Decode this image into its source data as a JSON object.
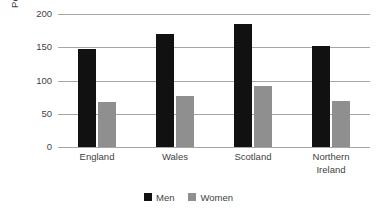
{
  "chart_data": {
    "type": "bar",
    "title": "",
    "subtitle": "",
    "xlabel": "",
    "ylabel": "Per 100,000 deaths",
    "ylim": [
      0,
      200
    ],
    "yticks": [
      200,
      150,
      100,
      50,
      0
    ],
    "ytick_labels": [
      "200",
      "150",
      "100",
      "50",
      "0"
    ],
    "grid": "horizontal",
    "legend_position": "bottom-center",
    "categories": [
      "England",
      "Wales",
      "Scotland",
      "Northern Ireland"
    ],
    "category_label_lines": [
      [
        "England"
      ],
      [
        "Wales"
      ],
      [
        "Scotland"
      ],
      [
        "Northern",
        "Ireland"
      ]
    ],
    "series": [
      {
        "name": "Men",
        "color": "#111111",
        "values": [
          148,
          170,
          185,
          152
        ]
      },
      {
        "name": "Women",
        "color": "#8f8f8f",
        "values": [
          67,
          76,
          92,
          69
        ]
      }
    ]
  },
  "legend": {
    "items": [
      {
        "label": "Men"
      },
      {
        "label": "Women"
      }
    ]
  },
  "colors": {
    "men": "#111111",
    "women": "#8f8f8f",
    "gridline": "#a6a6a6",
    "text": "#3f3f3f",
    "background": "#ffffff"
  }
}
